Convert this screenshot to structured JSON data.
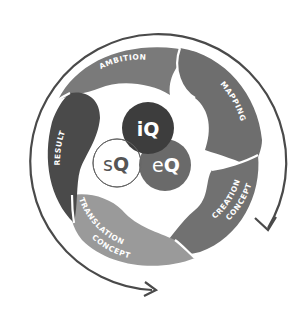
{
  "diagram": {
    "type": "cycle",
    "segments": [
      {
        "id": "ambition",
        "label": "AMBITION",
        "color": "#7a7a7a"
      },
      {
        "id": "mapping",
        "label": "MAPPING",
        "color": "#6e6e6e"
      },
      {
        "id": "concept-creation",
        "label_line1": "CONCEPT",
        "label_line2": "CREATION",
        "color": "#717171"
      },
      {
        "id": "concept-translation",
        "label_line1": "CONCEPT",
        "label_line2": "TRANSLATION",
        "color": "#9a9a9a"
      },
      {
        "id": "result",
        "label": "RESULT",
        "color": "#4a4a4a"
      }
    ],
    "center": {
      "iq": {
        "prefix": "i",
        "suffix": "Q",
        "color": "#3d3d3d"
      },
      "eq": {
        "prefix": "e",
        "suffix": "Q",
        "color": "#6a6a6a"
      },
      "sq": {
        "prefix": "s",
        "suffix": "Q",
        "color": "#ffffff",
        "stroke": "#666666"
      }
    },
    "outer_arrow": {
      "color": "#4a4a4a",
      "direction": "clockwise"
    }
  }
}
